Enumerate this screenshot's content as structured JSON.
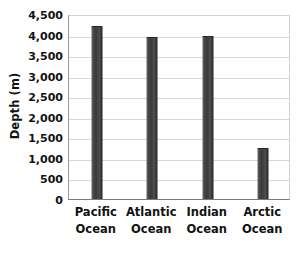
{
  "chart_data": {
    "type": "bar",
    "title": "",
    "subtitle": "",
    "xlabel": "",
    "ylabel": "Depth (m)",
    "categories": [
      "Pacific Ocean",
      "Atlantic Ocean",
      "Indian Ocean",
      "Arctic Ocean"
    ],
    "category_lines": [
      [
        "Pacific",
        "Ocean"
      ],
      [
        "Atlantic",
        "Ocean"
      ],
      [
        "Indian",
        "Ocean"
      ],
      [
        "Arctic",
        "Ocean"
      ]
    ],
    "values": [
      4200,
      3930,
      3960,
      1250
    ],
    "ylim": [
      0,
      4500
    ],
    "ytick_step": 500,
    "ytick_values": [
      4500,
      4000,
      3500,
      3000,
      2500,
      2000,
      1500,
      1000,
      500,
      0
    ],
    "ytick_labels": [
      "4,500",
      "4,000",
      "3,500",
      "3,000",
      "2,500",
      "2,000",
      "1,500",
      "1,000",
      "500",
      "0"
    ],
    "grid": true,
    "grid_axis": "y",
    "legend": false,
    "legend_position": "none",
    "bar_color": "#3d3d3d",
    "gridline_color": "#d8d8d8",
    "axis_color": "#7a7a7a",
    "text_color": "#121212",
    "background_color": "#ffffff"
  }
}
